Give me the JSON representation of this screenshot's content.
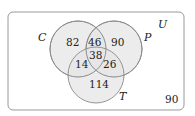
{
  "diagram": {
    "type": "venn",
    "universe_label": "U",
    "outside_count": "90",
    "sets": [
      {
        "name": "C",
        "label": "C"
      },
      {
        "name": "P",
        "label": "P"
      },
      {
        "name": "T",
        "label": "T"
      }
    ],
    "regions": {
      "c_only": "82",
      "p_only": "90",
      "t_only": "114",
      "c_and_p_only": "46",
      "c_and_t_only": "14",
      "p_and_t_only": "26",
      "c_p_t": "38"
    },
    "colors": {
      "circle_fill": "#e6e6e6",
      "circle_stroke": "#8a8a8a",
      "frame_stroke": "#9a9a9a"
    }
  }
}
